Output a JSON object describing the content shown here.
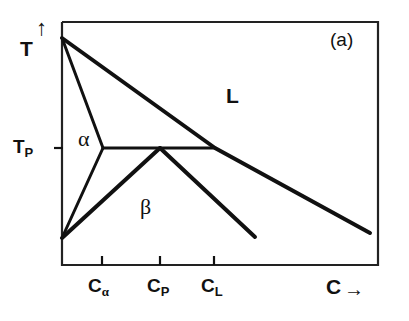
{
  "figure": {
    "panel_label": "(a)",
    "type": "peritectic-binary-phase-diagram"
  },
  "axes": {
    "y_title": "T",
    "y_arrow": "↑",
    "x_title": "C",
    "x_arrow": "→",
    "y_tick_labels": [
      {
        "base": "T",
        "sub": "P",
        "pixel_y": 148
      }
    ],
    "x_tick_labels": [
      {
        "base": "C",
        "sub": "α",
        "pixel_x": 102
      },
      {
        "base": "C",
        "sub": "P",
        "pixel_x": 160
      },
      {
        "base": "C",
        "sub": "L",
        "pixel_x": 214
      }
    ]
  },
  "phase_labels": [
    {
      "text": "α",
      "x": 78,
      "y": 128
    },
    {
      "text": "β",
      "x": 140,
      "y": 196
    },
    {
      "text": "L",
      "x": 226,
      "y": 85
    }
  ],
  "colors": {
    "line": "#111111",
    "frame": "#222222",
    "background": "#ffffff"
  },
  "chart_data": {
    "type": "line",
    "title": "(a)",
    "xlabel": "C",
    "ylabel": "T",
    "grid": false,
    "legend": "none",
    "xlim": [
      62,
      378
    ],
    "ylim_pixels": [
      22,
      265
    ],
    "note": "Axis values are unlabeled/schematic; coordinates are in pixel space of the plot frame. Temperature increases upward, composition increases rightward.",
    "annotations": [
      {
        "label": "T_P",
        "meaning": "peritectic temperature",
        "pixel_y": 148
      },
      {
        "label": "C_alpha",
        "meaning": "alpha solidus composition at T_P",
        "pixel_x": 102
      },
      {
        "label": "C_P",
        "meaning": "peritectic composition",
        "pixel_x": 160
      },
      {
        "label": "C_L",
        "meaning": "liquid composition at T_P",
        "pixel_x": 214
      }
    ],
    "series": [
      {
        "name": "liquidus",
        "points": [
          [
            62,
            38
          ],
          [
            215,
            148
          ],
          [
            370,
            233
          ]
        ],
        "width": 4
      },
      {
        "name": "alpha-liquidus-boundary",
        "points": [
          [
            62,
            38
          ],
          [
            103,
            148
          ]
        ],
        "width": 3
      },
      {
        "name": "alpha-solvus",
        "points": [
          [
            103,
            148
          ],
          [
            62,
            238
          ]
        ],
        "width": 3
      },
      {
        "name": "peritectic-horizontal",
        "points": [
          [
            103,
            148
          ],
          [
            215,
            148
          ]
        ],
        "width": 3
      },
      {
        "name": "beta-solidus-left",
        "points": [
          [
            62,
            238
          ],
          [
            160,
            148
          ]
        ],
        "width": 4
      },
      {
        "name": "beta-solidus-right",
        "points": [
          [
            160,
            148
          ],
          [
            255,
            237
          ]
        ],
        "width": 4
      }
    ],
    "frame": {
      "left": 62,
      "right": 378,
      "top": 22,
      "bottom": 265
    }
  }
}
